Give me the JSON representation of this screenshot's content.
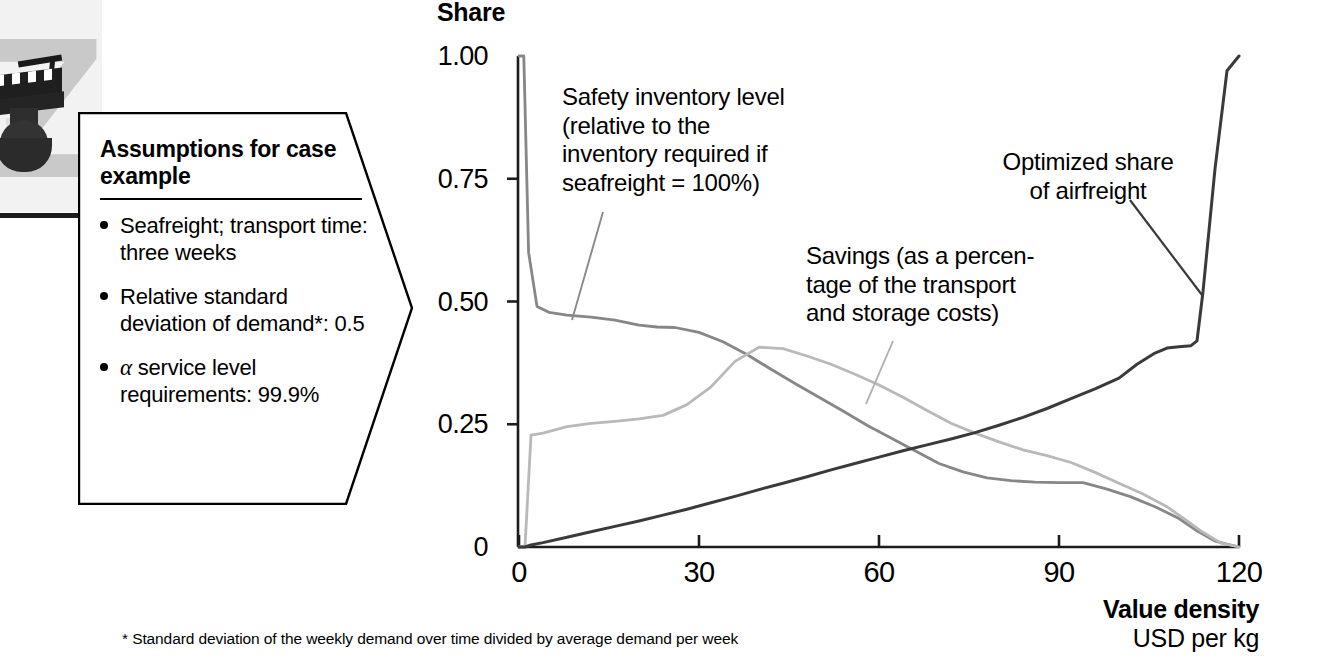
{
  "decor": {
    "icon": "chess-rook-photo",
    "backdrop_letter": "Z"
  },
  "callout": {
    "title": "Assumptions for case example",
    "bullets": [
      {
        "text": "Seafreight; transport time: three weeks"
      },
      {
        "text": "Relative standard deviation of demand*: 0.5"
      },
      {
        "prefix_symbol": "α",
        "text": " service level requirements: 99.9%"
      }
    ]
  },
  "chart_data": {
    "type": "line",
    "title": "Share",
    "xlabel": "Value density",
    "xlabel_unit": "USD per kg",
    "ylabel": "Share",
    "xlim": [
      0,
      120
    ],
    "ylim": [
      0,
      1.0
    ],
    "grid": false,
    "legend": "annotations-on-plot",
    "xticks": [
      0,
      30,
      60,
      90,
      120
    ],
    "xticklabels": [
      "0",
      "30",
      "60",
      "90",
      "120"
    ],
    "yticks": [
      0,
      0.25,
      0.5,
      0.75,
      1.0
    ],
    "yticklabels": [
      "0",
      "0.25",
      "0.50",
      "0.75",
      "1.00"
    ],
    "series": [
      {
        "name": "Safety inventory level (relative to the inventory required if seafreight = 100%)",
        "color": "#878787",
        "x": [
          0,
          0.8,
          1.6,
          3,
          5,
          8,
          12,
          16,
          20,
          23,
          26,
          30,
          34,
          38,
          42,
          46,
          50,
          54,
          58,
          62,
          66,
          70,
          74,
          78,
          82,
          86,
          90,
          94,
          98,
          102,
          106,
          110,
          113,
          116,
          120
        ],
        "y": [
          1.0,
          1.0,
          0.6,
          0.49,
          0.478,
          0.472,
          0.468,
          0.462,
          0.452,
          0.448,
          0.447,
          0.437,
          0.418,
          0.392,
          0.362,
          0.333,
          0.305,
          0.277,
          0.248,
          0.222,
          0.196,
          0.17,
          0.153,
          0.141,
          0.135,
          0.132,
          0.131,
          0.131,
          0.118,
          0.102,
          0.082,
          0.058,
          0.033,
          0.012,
          0.0
        ]
      },
      {
        "name": "Savings (as a percentage of the transport and storage costs)",
        "color": "#b9b9b9",
        "x": [
          0,
          1,
          2,
          4,
          8,
          12,
          16,
          20,
          24,
          28,
          32,
          36,
          40,
          44,
          48,
          52,
          56,
          60,
          64,
          68,
          72,
          76,
          80,
          84,
          88,
          92,
          96,
          100,
          104,
          108,
          111,
          114,
          117,
          120
        ],
        "y": [
          0.0,
          0.0,
          0.228,
          0.232,
          0.245,
          0.252,
          0.256,
          0.261,
          0.268,
          0.29,
          0.326,
          0.378,
          0.407,
          0.404,
          0.389,
          0.372,
          0.352,
          0.33,
          0.305,
          0.278,
          0.252,
          0.232,
          0.214,
          0.198,
          0.186,
          0.172,
          0.152,
          0.13,
          0.108,
          0.082,
          0.056,
          0.03,
          0.008,
          0.0
        ]
      },
      {
        "name": "Optimized share of airfreight",
        "color": "#3a3a3a",
        "x": [
          0,
          1,
          2,
          4,
          8,
          12,
          16,
          20,
          24,
          28,
          32,
          36,
          40,
          44,
          48,
          52,
          56,
          60,
          64,
          68,
          72,
          76,
          80,
          84,
          88,
          92,
          96,
          100,
          103,
          106,
          108,
          110,
          112,
          113,
          114,
          116,
          118,
          120
        ],
        "y": [
          0.0,
          0.0,
          0.004,
          0.009,
          0.02,
          0.031,
          0.042,
          0.053,
          0.065,
          0.077,
          0.09,
          0.103,
          0.117,
          0.13,
          0.143,
          0.157,
          0.17,
          0.183,
          0.196,
          0.208,
          0.22,
          0.233,
          0.248,
          0.264,
          0.282,
          0.302,
          0.322,
          0.344,
          0.372,
          0.395,
          0.405,
          0.408,
          0.41,
          0.42,
          0.52,
          0.77,
          0.97,
          1.0
        ]
      }
    ],
    "annotations": [
      {
        "name": "safety-inventory-annotation",
        "text": "Safety inventory level (relative to the inventory required if seafreight = 100%)"
      },
      {
        "name": "savings-annotation",
        "text": "Savings (as a percentage of the transport and storage costs)"
      },
      {
        "name": "airfreight-annotation",
        "text": "Optimized share of airfreight"
      }
    ]
  },
  "annotation_lines": {
    "safety": [
      "Safety inventory level",
      "(relative to the",
      "inventory required if",
      "seafreight = 100%)"
    ],
    "savings": [
      "Savings (as a percen-",
      "tage of the transport",
      "and storage costs)"
    ],
    "airfreight": [
      "Optimized share",
      "of airfreight"
    ]
  },
  "footnote": "* Standard deviation of the weekly demand over time divided by average demand per week"
}
